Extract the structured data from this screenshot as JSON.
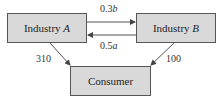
{
  "nodes": {
    "industry_a": {
      "name": "Industry",
      "var": "A"
    },
    "industry_b": {
      "name": "Industry",
      "var": "B"
    },
    "consumer": {
      "name": "Consumer"
    }
  },
  "edges": {
    "a_to_b": {
      "coef": "0.3",
      "var": "b"
    },
    "b_to_a": {
      "coef": "0.5",
      "var": "a"
    },
    "a_to_consumer": "310",
    "b_to_consumer": "100"
  },
  "colors": {
    "box_fill": "#d9d9d9",
    "line": "#555555"
  }
}
